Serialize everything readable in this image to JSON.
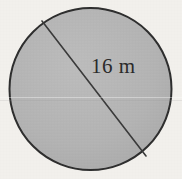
{
  "figure": {
    "kind": "geometry-diagram",
    "shape_name": "circle",
    "background_color": "#f2f0ec",
    "canvas": {
      "width": 182,
      "height": 179
    }
  },
  "circle": {
    "fill_color": "#b4b4b4",
    "stroke_color": "#2d2d2d",
    "stroke_width": 2,
    "center_x": 90.5,
    "center_y": 89,
    "radius": 82
  },
  "chord": {
    "label": "16 m",
    "value": 16,
    "unit": "m",
    "stroke_color": "#3a3a3a",
    "stroke_width": 1.6,
    "x1": 42,
    "y1": 21,
    "x2": 146,
    "y2": 156
  },
  "label": {
    "text": "16 m",
    "color": "#2a2a2a",
    "font_size_px": 21
  },
  "artifacts": {
    "scan_line_note": "faint horizontal scan band"
  }
}
